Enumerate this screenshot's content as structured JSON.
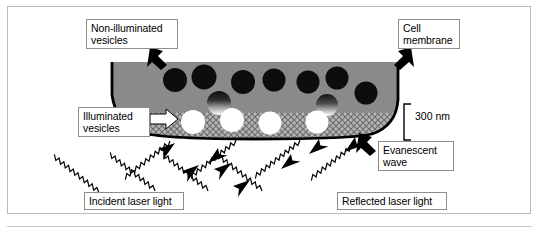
{
  "figure": {
    "type": "scientific-schematic",
    "canvas": {
      "width": 539,
      "height": 233
    },
    "frame": {
      "border_color": "#b9b9b9",
      "background": "#ffffff"
    }
  },
  "labels": {
    "non_illuminated_vesicles": "Non-illuminated\nvesicles",
    "cell_membrane": "Cell\nmembrane",
    "illuminated_vesicles": "Illuminated\nvesicles",
    "evanescent_wave": "Evanescent\nwave",
    "incident_laser_light": "Incident laser light",
    "reflected_laser_light": "Reflected laser light",
    "scale_depth": "300 nm"
  },
  "colors": {
    "cytoplasm_gray": "#8a8a8a",
    "vesicle_dark": "#0d0d0d",
    "vesicle_illuminated": "#ffffff",
    "membrane_outline": "#000000",
    "evanescent_band_base": "#b0b0b0",
    "hatch_line": "#6f6f6f",
    "callout_border": "#8d8d8d",
    "frame_border": "#b9b9b9",
    "beam_stroke": "#000000",
    "text": "#000000"
  },
  "cell": {
    "shape": "half-dome / flattened semicircle resting on coverslip",
    "left_x": 112,
    "right_x": 398,
    "top_y": 62,
    "bottom_y": 138,
    "fill": "#8a8a8a",
    "outline_width": 2.6
  },
  "evanescent_band": {
    "description": "hatched cross-pattern band at cell base indicating evanescent field penetration depth",
    "depth_label": "300 nm",
    "top_y": 113,
    "bottom_y": 138,
    "pattern": "cross-hatch diamond dither"
  },
  "vesicles": {
    "non_illuminated": [
      {
        "cx": 175,
        "cy": 80,
        "r": 12
      },
      {
        "cx": 204,
        "cy": 77,
        "r": 12.5
      },
      {
        "cx": 243,
        "cy": 82,
        "r": 12
      },
      {
        "cx": 274,
        "cy": 80,
        "r": 11.5
      },
      {
        "cx": 308,
        "cy": 82,
        "r": 11.5
      },
      {
        "cx": 337,
        "cy": 78,
        "r": 11.5
      },
      {
        "cx": 366,
        "cy": 93,
        "r": 11.5
      }
    ],
    "partially_illuminated": [
      {
        "cx": 219,
        "cy": 103,
        "r": 12,
        "gradient": "dark-top-to-white-bottom"
      },
      {
        "cx": 327,
        "cy": 105,
        "r": 11,
        "gradient": "dark-top-to-white-bottom"
      }
    ],
    "illuminated": [
      {
        "cx": 193,
        "cy": 122,
        "r": 12
      },
      {
        "cx": 232,
        "cy": 120,
        "r": 12
      },
      {
        "cx": 270,
        "cy": 123,
        "r": 11.5
      },
      {
        "cx": 317,
        "cy": 122,
        "r": 11.5
      }
    ]
  },
  "pointer_arrows": [
    {
      "name": "arrow-to-non-illuminated-vesicle",
      "style": "black-block",
      "points_to": "dark vesicle region",
      "direction": "down-right"
    },
    {
      "name": "arrow-to-cell-membrane",
      "style": "black-block",
      "points_to": "cell outline at right",
      "direction": "down-left"
    },
    {
      "name": "arrow-to-illuminated-vesicles",
      "style": "white-block",
      "points_to": "hatched band",
      "direction": "right"
    },
    {
      "name": "arrow-to-evanescent-wave",
      "style": "black-block",
      "points_to": "base of cell",
      "direction": "up-left"
    }
  ],
  "beams": {
    "incident": {
      "count": 4,
      "direction": "up-and-to-the-right",
      "render": "sawtooth zigzag with solid triangular arrowhead",
      "label": "Incident laser light"
    },
    "reflected": {
      "count": 4,
      "direction": "down-and-to-the-right",
      "render": "sawtooth zigzag with solid triangular arrowhead",
      "label": "Reflected laser light"
    }
  },
  "scale_bracket": {
    "label": "300 nm",
    "x": 404,
    "top_y": 104,
    "bottom_y": 140
  }
}
